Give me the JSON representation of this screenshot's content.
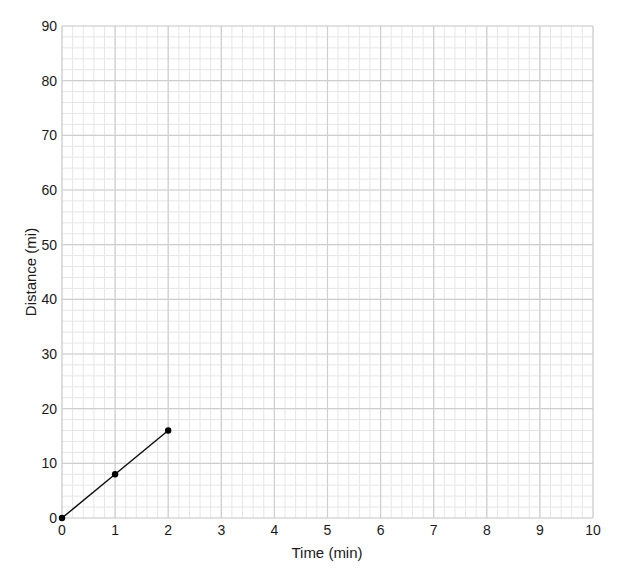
{
  "chart_data": {
    "type": "line",
    "title": "",
    "xlabel": "Time (min)",
    "ylabel": "Distance (mi)",
    "xlim": [
      0,
      10
    ],
    "ylim": [
      0,
      90
    ],
    "x_ticks": [
      0,
      1,
      2,
      3,
      4,
      5,
      6,
      7,
      8,
      9,
      10
    ],
    "y_ticks": [
      0,
      10,
      20,
      30,
      40,
      50,
      60,
      70,
      80,
      90
    ],
    "grid": true,
    "grid_minor_divisions": {
      "x": 5,
      "y": 5
    },
    "legend": null,
    "series": [
      {
        "name": "distance",
        "x": [
          0,
          1,
          2
        ],
        "y": [
          0,
          8,
          16
        ],
        "markers": true,
        "color": "#000000"
      }
    ]
  },
  "style": {
    "major_grid_color": "#cfcfcf",
    "minor_grid_color": "#e6e6e6",
    "line_color": "#111111"
  }
}
